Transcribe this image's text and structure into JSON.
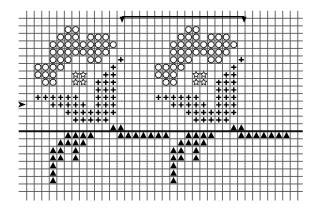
{
  "grid": {
    "cols": 36,
    "rows": 23,
    "origin_x": 26.7,
    "origin_y": 18.3,
    "cell": 7.53,
    "line_color": "#555555",
    "heavy_line_after_row": 15,
    "symbol_color": "#000000"
  },
  "legend_symbols": {
    "circle": "open-circle-stitch",
    "star": "star-stitch",
    "plus": "plus-stitch",
    "triangle": "filled-triangle-stitch"
  },
  "repeat_bracket": {
    "from_col": 13,
    "to_col": 29,
    "label": "repeat"
  },
  "row_marker": {
    "row": 11,
    "glyph": "arrow-right"
  },
  "motif_offset_cols": 16,
  "motif": {
    "circle": [
      [
        5,
        1
      ],
      [
        6,
        1
      ],
      [
        4,
        2
      ],
      [
        5,
        2
      ],
      [
        6,
        2
      ],
      [
        8,
        2
      ],
      [
        9,
        2
      ],
      [
        10,
        2
      ],
      [
        3,
        3
      ],
      [
        4,
        3
      ],
      [
        5,
        3
      ],
      [
        6,
        3
      ],
      [
        7,
        3
      ],
      [
        8,
        3
      ],
      [
        9,
        3
      ],
      [
        10,
        3
      ],
      [
        11,
        3
      ],
      [
        3,
        4
      ],
      [
        4,
        4
      ],
      [
        5,
        4
      ],
      [
        6,
        4
      ],
      [
        7,
        4
      ],
      [
        8,
        4
      ],
      [
        9,
        4
      ],
      [
        10,
        4
      ],
      [
        3,
        5
      ],
      [
        4,
        5
      ],
      [
        5,
        5
      ],
      [
        8,
        5
      ],
      [
        9,
        5
      ],
      [
        1,
        6
      ],
      [
        2,
        6
      ],
      [
        3,
        6
      ],
      [
        4,
        6
      ],
      [
        1,
        7
      ],
      [
        2,
        7
      ],
      [
        3,
        7
      ],
      [
        2,
        8
      ],
      [
        3,
        8
      ]
    ],
    "star": [
      [
        6,
        7
      ],
      [
        7,
        7
      ],
      [
        6,
        8
      ],
      [
        7,
        8
      ]
    ],
    "plus": [
      [
        12,
        5
      ],
      [
        11,
        6
      ],
      [
        10,
        7
      ],
      [
        11,
        7
      ],
      [
        9,
        8
      ],
      [
        10,
        8
      ],
      [
        11,
        8
      ],
      [
        9,
        9
      ],
      [
        10,
        9
      ],
      [
        11,
        9
      ],
      [
        1,
        10
      ],
      [
        2,
        10
      ],
      [
        3,
        10
      ],
      [
        4,
        10
      ],
      [
        5,
        10
      ],
      [
        6,
        10
      ],
      [
        9,
        10
      ],
      [
        10,
        10
      ],
      [
        11,
        10
      ],
      [
        3,
        11
      ],
      [
        4,
        11
      ],
      [
        5,
        11
      ],
      [
        6,
        11
      ],
      [
        7,
        11
      ],
      [
        9,
        11
      ],
      [
        10,
        11
      ],
      [
        11,
        11
      ],
      [
        5,
        12
      ],
      [
        6,
        12
      ],
      [
        7,
        12
      ],
      [
        8,
        12
      ],
      [
        9,
        12
      ],
      [
        10,
        12
      ],
      [
        11,
        12
      ],
      [
        6,
        13
      ],
      [
        7,
        13
      ],
      [
        8,
        13
      ],
      [
        9,
        13
      ],
      [
        10,
        13
      ]
    ],
    "triangle": [
      [
        11,
        14
      ],
      [
        12,
        14
      ],
      [
        5,
        15
      ],
      [
        6,
        15
      ],
      [
        7,
        15
      ],
      [
        8,
        15
      ],
      [
        12,
        15
      ],
      [
        13,
        15
      ],
      [
        14,
        15
      ],
      [
        15,
        15
      ],
      [
        16,
        15
      ],
      [
        17,
        15
      ],
      [
        18,
        15
      ],
      [
        4,
        16
      ],
      [
        5,
        16
      ],
      [
        6,
        16
      ],
      [
        7,
        16
      ],
      [
        3,
        17
      ],
      [
        4,
        17
      ],
      [
        6,
        17
      ],
      [
        3,
        18
      ],
      [
        4,
        18
      ],
      [
        6,
        18
      ],
      [
        3,
        19
      ],
      [
        3,
        20
      ],
      [
        3,
        21
      ]
    ]
  },
  "motif_repeats": 2
}
